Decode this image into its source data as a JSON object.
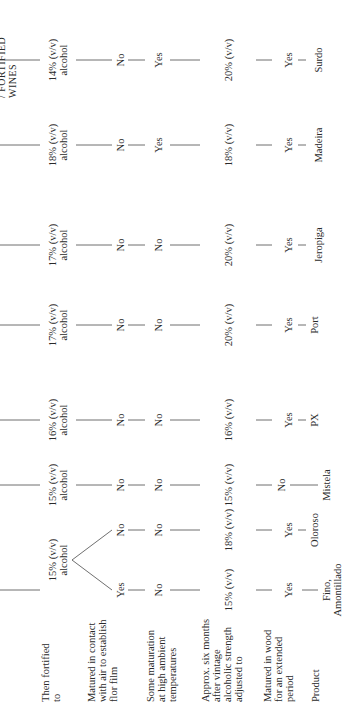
{
  "header": {
    "running_title": "/ FORTIFIED WINES"
  },
  "row_labels": [
    {
      "id": "fortified",
      "text": "Then fortified\nto"
    },
    {
      "id": "contact",
      "text": "Matured in contact\nwith air to establish\nflor film"
    },
    {
      "id": "ambient",
      "text": "Some maturation\nat high ambient\ntemperatures"
    },
    {
      "id": "adjusted",
      "text": "Approx. six months\nafter vintage\nalcoholic strength\nadjusted to"
    },
    {
      "id": "wood",
      "text": "Matured in wood\nfor an extended\nperiod"
    },
    {
      "id": "product",
      "text": "Product"
    }
  ],
  "sherry_branch": {
    "fortified": "15% (v/v)\nalcohol",
    "branches": [
      {
        "contact": "Yes",
        "ambient": "No",
        "adjusted": "15% (v/v)",
        "wood": "Yes",
        "product": "Fino,\nAmontillado"
      },
      {
        "contact": "No",
        "ambient": "No",
        "adjusted": "18% (v/v)",
        "wood": "Yes",
        "product": "Oloroso"
      }
    ]
  },
  "columns": [
    {
      "fortified": "15% (v/v)\nalcohol",
      "contact": "No",
      "ambient": "No",
      "adjusted": "15% (v/v)",
      "wood": "No",
      "product": "Mistela"
    },
    {
      "fortified": "16% (v/v)\nalcohol",
      "contact": "No",
      "ambient": "No",
      "adjusted": "16% (v/v)",
      "wood": "Yes",
      "product": "PX"
    },
    {
      "fortified": "17% (v/v)\nalcohol",
      "contact": "No",
      "ambient": "No",
      "adjusted": "20% (v/v)",
      "wood": "Yes",
      "product": "Port"
    },
    {
      "fortified": "17% (v/v)\nalcohol",
      "contact": "No",
      "ambient": "No",
      "adjusted": "20% (v/v)",
      "wood": "Yes",
      "product": "Jeropiga"
    },
    {
      "fortified": "18% (v/v)\nalcohol",
      "contact": "No",
      "ambient": "Yes",
      "adjusted": "18% (v/v)",
      "wood": "Yes",
      "product": "Madeira"
    },
    {
      "fortified": "14% (v/v)\nalcohol",
      "contact": "No",
      "ambient": "Yes",
      "adjusted": "20% (v/v)",
      "wood": "Yes",
      "product": "Surdo"
    }
  ]
}
